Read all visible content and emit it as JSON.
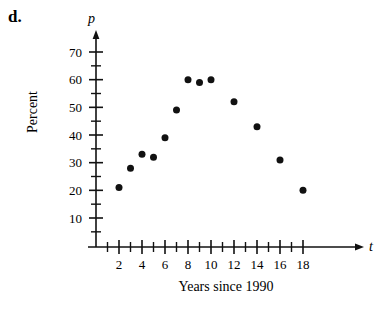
{
  "figure": {
    "part_label": "d.",
    "y_axis_variable": "p",
    "x_axis_variable": "t",
    "y_axis_title": "Percent",
    "x_axis_title": "Years since 1990",
    "ink_color": "#111111",
    "background_color": "#ffffff"
  },
  "chart_data": {
    "type": "scatter",
    "title": "",
    "subtitle": "",
    "xlabel": "Years since 1990",
    "ylabel": "Percent",
    "xlim": [
      0,
      19
    ],
    "ylim": [
      0,
      75
    ],
    "grid": false,
    "legend": null,
    "x_major_ticks": [
      2,
      4,
      6,
      8,
      10,
      12,
      14,
      16,
      18
    ],
    "x_minor_ticks": [
      1,
      3,
      5,
      7,
      9,
      11,
      13,
      15,
      17
    ],
    "x_tick_labels": [
      "2",
      "4",
      "6",
      "8",
      "10",
      "12",
      "14",
      "16",
      "18"
    ],
    "y_major_ticks": [
      10,
      20,
      30,
      40,
      50,
      60,
      70
    ],
    "y_minor_ticks": [
      5,
      15,
      25,
      35,
      45,
      55,
      65
    ],
    "y_tick_labels": [
      "10",
      "20",
      "30",
      "40",
      "50",
      "60",
      "70"
    ],
    "marker": "filled-circle",
    "marker_color": "#111111",
    "marker_size": 7,
    "x": [
      2,
      3,
      4,
      5,
      6,
      7,
      8,
      9,
      10,
      12,
      14,
      16,
      18
    ],
    "y": [
      21,
      28,
      33,
      32,
      39,
      49,
      60,
      59,
      60,
      52,
      43,
      31,
      20
    ],
    "points": [
      {
        "t": 2,
        "p": 21
      },
      {
        "t": 3,
        "p": 28
      },
      {
        "t": 4,
        "p": 33
      },
      {
        "t": 5,
        "p": 32
      },
      {
        "t": 6,
        "p": 39
      },
      {
        "t": 7,
        "p": 49
      },
      {
        "t": 8,
        "p": 60
      },
      {
        "t": 9,
        "p": 59
      },
      {
        "t": 10,
        "p": 60
      },
      {
        "t": 12,
        "p": 52
      },
      {
        "t": 14,
        "p": 43
      },
      {
        "t": 16,
        "p": 31
      },
      {
        "t": 18,
        "p": 20
      }
    ]
  }
}
